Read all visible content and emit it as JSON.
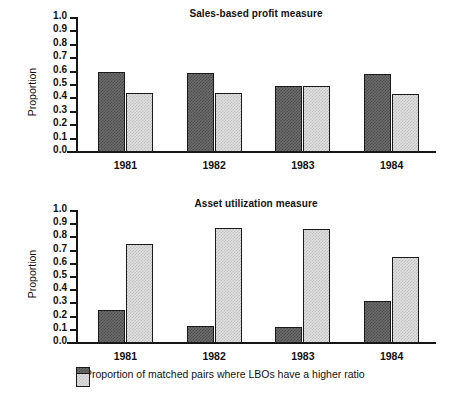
{
  "figure": {
    "ylabel": "Proportion",
    "categories": [
      "1981",
      "1982",
      "1983",
      "1984"
    ],
    "yticks": [
      "1.0",
      "0.9",
      "0.8",
      "0.7",
      "0.6",
      "0.5",
      "0.4",
      "0.3",
      "0.2",
      "0.1",
      "0.0"
    ],
    "colors": {
      "series_dark": "#6e6e6e",
      "series_light": "#e2e2e2",
      "axis": "#151515",
      "text": "#111111",
      "background": "#ffffff"
    }
  },
  "legend": {
    "items": [
      {
        "swatch": "dark-checker-swatch",
        "label": "Proportion of matched pairs where LBOs have a higher ratio"
      },
      {
        "swatch": "light-checker-swatch",
        "label": ""
      }
    ]
  },
  "chart_data": [
    {
      "type": "bar",
      "title": "Sales-based profit measure",
      "xlabel": "",
      "ylabel": "Proportion",
      "categories": [
        "1981",
        "1982",
        "1983",
        "1984"
      ],
      "ylim": [
        0.0,
        1.0
      ],
      "ytick_values": [
        0.0,
        0.1,
        0.2,
        0.3,
        0.4,
        0.5,
        0.6,
        0.7,
        0.8,
        0.9,
        1.0
      ],
      "grid": false,
      "legend_position": "below-figure",
      "series": [
        {
          "name": "Proportion of matched pairs where LBOs have a higher ratio",
          "style": "dark-checker",
          "values": [
            0.6,
            0.59,
            0.49,
            0.58
          ]
        },
        {
          "name": "",
          "style": "light-checker",
          "values": [
            0.44,
            0.44,
            0.49,
            0.43
          ]
        }
      ]
    },
    {
      "type": "bar",
      "title": "Asset utilization measure",
      "xlabel": "",
      "ylabel": "Proportion",
      "categories": [
        "1981",
        "1982",
        "1983",
        "1984"
      ],
      "ylim": [
        0.0,
        1.0
      ],
      "ytick_values": [
        0.0,
        0.1,
        0.2,
        0.3,
        0.4,
        0.5,
        0.6,
        0.7,
        0.8,
        0.9,
        1.0
      ],
      "grid": false,
      "legend_position": "below-figure",
      "series": [
        {
          "name": "Proportion of matched pairs where LBOs have a higher ratio",
          "style": "dark-checker",
          "values": [
            0.25,
            0.13,
            0.12,
            0.32
          ]
        },
        {
          "name": "",
          "style": "light-checker",
          "values": [
            0.75,
            0.87,
            0.86,
            0.65
          ]
        }
      ]
    }
  ]
}
